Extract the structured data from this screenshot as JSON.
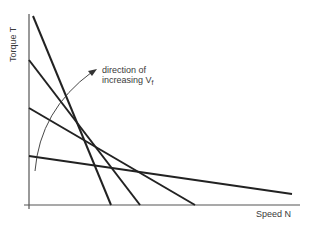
{
  "diagram": {
    "y_axis_label": "Torque T",
    "x_axis_label": "Speed N",
    "annotation_line1": "direction of",
    "annotation_line2": "increasing V",
    "annotation_subscript": "f",
    "colors": {
      "line": "#222222",
      "axis": "#555555",
      "text": "#3a3a3a"
    },
    "curves": [
      {
        "name": "torque-speed-line-1",
        "x1": 33,
        "y1": 16,
        "x2": 111,
        "y2": 205
      },
      {
        "name": "torque-speed-line-2",
        "x1": 29,
        "y1": 60,
        "x2": 140,
        "y2": 205
      },
      {
        "name": "torque-speed-line-3",
        "x1": 29,
        "y1": 108,
        "x2": 195,
        "y2": 205
      },
      {
        "name": "torque-speed-line-4",
        "x1": 29,
        "y1": 156,
        "x2": 292,
        "y2": 194
      }
    ]
  }
}
